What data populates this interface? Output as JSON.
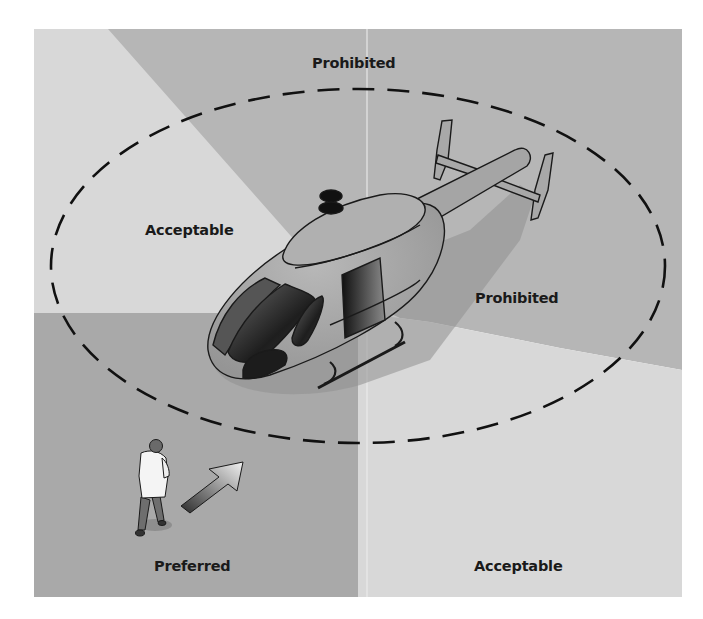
{
  "figure": {
    "type": "helicopter approach zones diagram",
    "zones": {
      "top": {
        "label": "Prohibited",
        "color": "#b6b6b6"
      },
      "upper_left": {
        "label": "Acceptable",
        "color": "#d8d8d8"
      },
      "right": {
        "label": "Prohibited",
        "color": "#b6b6b6"
      },
      "lower_left": {
        "label": "Preferred",
        "color": "#a9a9a9"
      },
      "lower_right": {
        "label": "Acceptable",
        "color": "#d8d8d8"
      }
    },
    "boundary": {
      "style": "dashed ellipse",
      "color": "#111111"
    },
    "icons": {
      "helicopter": "helicopter-illustration",
      "person": "walking-person-in-white-coat",
      "arrow": "direction-arrow-toward-helicopter"
    }
  }
}
